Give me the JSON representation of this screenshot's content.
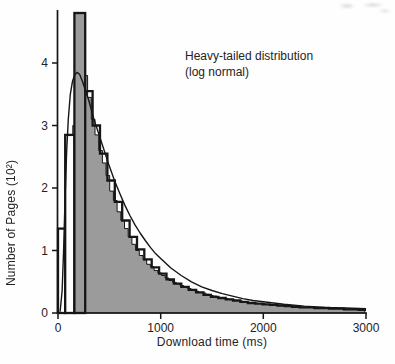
{
  "figure": {
    "annotation_line1": "Heavy-tailed distribution",
    "annotation_line2": "(log normal)",
    "x_axis_label": "Download time (ms)",
    "y_axis_label": "Number of Pages (10²)"
  },
  "chart_data": {
    "type": "bar",
    "subtype": "histogram-with-lognormal-fit",
    "title": "",
    "annotation": "Heavy-tailed distribution (log normal)",
    "xlabel": "Download time (ms)",
    "ylabel": "Number of Pages (10²)",
    "xlim": [
      0,
      3000
    ],
    "ylim": [
      0,
      4.85
    ],
    "x_ticks": [
      0,
      1000,
      2000,
      3000
    ],
    "y_ticks": [
      0,
      1,
      2,
      3,
      4
    ],
    "grid": false,
    "legend": "none",
    "colors": {
      "histogram_fill": "#9b9b9b",
      "ink": "#161616",
      "background": "#ffffff"
    },
    "gray_histogram_fine": {
      "bin_width_ms": 36,
      "start_ms": 0,
      "values": [
        0.05,
        0.35,
        0.95,
        1.8,
        3.0,
        4.75,
        4.4,
        3.8,
        3.45,
        3.1,
        2.85,
        2.6,
        2.4,
        2.2,
        1.95,
        1.8,
        1.62,
        1.48,
        1.35,
        1.22,
        1.1,
        1.0,
        0.92,
        0.85,
        0.78,
        0.74,
        0.68,
        0.64,
        0.6,
        0.56,
        0.52,
        0.49,
        0.47,
        0.44,
        0.42,
        0.39,
        0.37,
        0.35,
        0.33,
        0.32,
        0.3,
        0.28,
        0.27,
        0.25,
        0.24,
        0.23,
        0.22,
        0.21,
        0.2,
        0.19,
        0.18,
        0.17,
        0.17,
        0.16,
        0.15,
        0.15,
        0.14,
        0.13,
        0.13,
        0.12,
        0.12,
        0.11,
        0.11,
        0.1,
        0.1,
        0.1,
        0.09,
        0.09,
        0.09,
        0.08,
        0.08,
        0.08,
        0.08,
        0.07,
        0.07,
        0.07,
        0.07,
        0.06,
        0.06,
        0.06,
        0.06,
        0.05,
        0.05
      ]
    },
    "outlined_bars": [
      {
        "x0_ms": 0,
        "x1_ms": 70,
        "height": 1.35,
        "fill": "#ffffff"
      },
      {
        "x0_ms": 70,
        "x1_ms": 160,
        "height": 2.85,
        "fill": "#ffffff"
      },
      {
        "x0_ms": 160,
        "x1_ms": 265,
        "height": 4.8,
        "fill": "#9b9b9b"
      }
    ],
    "outline_steps": {
      "bin_width_ms": 72,
      "start_ms": 265,
      "values": [
        3.55,
        3.0,
        2.55,
        2.12,
        1.78,
        1.48,
        1.22,
        1.02,
        0.86,
        0.73,
        0.63,
        0.54,
        0.47,
        0.42,
        0.37,
        0.33,
        0.29,
        0.26,
        0.24,
        0.22,
        0.2,
        0.18,
        0.16,
        0.15,
        0.14,
        0.13,
        0.12,
        0.11,
        0.1,
        0.09,
        0.09,
        0.08,
        0.08,
        0.07,
        0.07,
        0.06,
        0.06,
        0.05
      ]
    },
    "fitted_curve": {
      "model": "log-normal",
      "peak_value": 3.85,
      "mode_ms": 190,
      "points_ms": [
        20,
        40,
        55,
        70,
        85,
        100,
        120,
        140,
        160,
        185,
        210,
        240,
        270,
        300,
        350,
        400,
        450,
        500,
        550,
        600,
        650,
        700,
        750,
        800,
        850,
        900,
        950,
        1000,
        1100,
        1200,
        1300,
        1400,
        1500,
        1600,
        1700,
        1800,
        1900,
        2000,
        2200,
        2400,
        2600,
        2800,
        3000
      ],
      "points_value": [
        0.02,
        0.35,
        1.0,
        1.9,
        2.6,
        3.1,
        3.5,
        3.7,
        3.8,
        3.85,
        3.82,
        3.7,
        3.55,
        3.4,
        3.1,
        2.85,
        2.6,
        2.35,
        2.12,
        1.92,
        1.73,
        1.56,
        1.41,
        1.28,
        1.16,
        1.05,
        0.95,
        0.87,
        0.72,
        0.6,
        0.5,
        0.42,
        0.36,
        0.31,
        0.27,
        0.23,
        0.2,
        0.18,
        0.14,
        0.11,
        0.09,
        0.08,
        0.07
      ]
    },
    "pixel_mapping": {
      "x0_px": 58,
      "px_per_ms": 0.102667,
      "baseline_y_px": 313,
      "px_per_unit": 62.5
    }
  }
}
